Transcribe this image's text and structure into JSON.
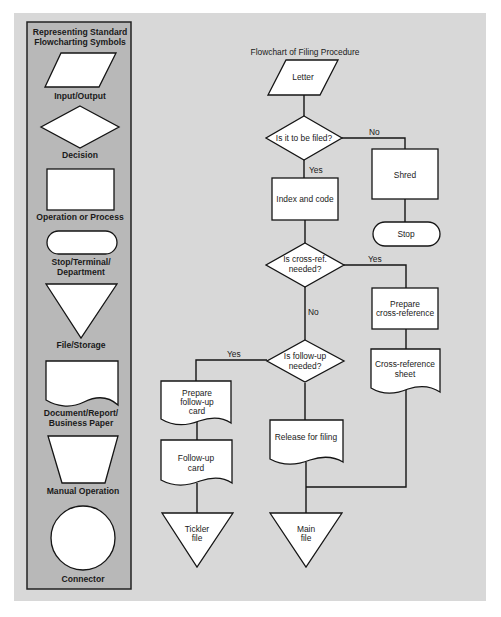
{
  "colors": {
    "page_background": "#ffffff",
    "outer_panel": "#d8d8d8",
    "legend_panel": "#b8b8b8",
    "legend_border": "#222222",
    "shape_fill": "#ffffff",
    "stroke": "#151515"
  },
  "legend": {
    "title_line1": "Representing Standard",
    "title_line2": "Flowcharting Symbols",
    "symbols": [
      {
        "shape": "parallelogram",
        "label": "Input/Output"
      },
      {
        "shape": "diamond",
        "label": "Decision"
      },
      {
        "shape": "rectangle",
        "label": "Operation or Process"
      },
      {
        "shape": "terminal",
        "label_line1": "Stop/Terminal/",
        "label_line2": "Department"
      },
      {
        "shape": "inverted-triangle",
        "label": "File/Storage"
      },
      {
        "shape": "document",
        "label_line1": "Document/Report/",
        "label_line2": "Business Paper"
      },
      {
        "shape": "trapezoid",
        "label": "Manual Operation"
      },
      {
        "shape": "circle",
        "label": "Connector"
      }
    ]
  },
  "flowchart": {
    "title": "Flowchart of Filing Procedure",
    "nodes": {
      "letter": {
        "shape": "parallelogram",
        "text": "Letter"
      },
      "to_be_filed": {
        "shape": "diamond",
        "text": "Is it to be filed?"
      },
      "shred": {
        "shape": "rectangle",
        "text": "Shred"
      },
      "stop": {
        "shape": "terminal",
        "text": "Stop"
      },
      "index_code": {
        "shape": "rectangle",
        "text": "Index and code"
      },
      "cross_ref_needed": {
        "shape": "diamond",
        "line1": "Is cross-ref.",
        "line2": "needed?"
      },
      "prepare_cross_ref": {
        "shape": "rectangle",
        "line1": "Prepare",
        "line2": "cross-reference"
      },
      "cross_ref_sheet": {
        "shape": "document",
        "line1": "Cross-reference",
        "line2": "sheet"
      },
      "follow_up_needed": {
        "shape": "diamond",
        "line1": "Is follow-up",
        "line2": "needed?"
      },
      "prepare_follow_up": {
        "shape": "document",
        "line1": "Prepare",
        "line2": "follow-up",
        "line3": "card"
      },
      "follow_up_card": {
        "shape": "document",
        "line1": "Follow-up",
        "line2": "card"
      },
      "release_filing": {
        "shape": "document",
        "text": "Release for filing"
      },
      "tickler_file": {
        "shape": "inverted-triangle",
        "line1": "Tickler",
        "line2": "file"
      },
      "main_file": {
        "shape": "inverted-triangle",
        "line1": "Main",
        "line2": "file"
      }
    },
    "edge_labels": {
      "filed_no": "No",
      "filed_yes": "Yes",
      "cross_ref_yes": "Yes",
      "cross_ref_no": "No",
      "follow_up_yes": "Yes"
    }
  }
}
